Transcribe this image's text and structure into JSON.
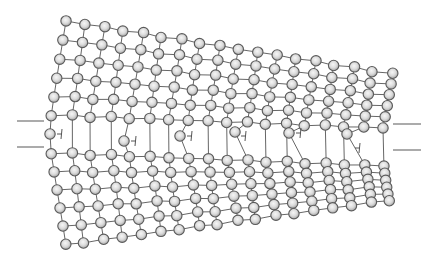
{
  "diagram": {
    "type": "crystal-lattice",
    "colors": {
      "background": "#ffffff",
      "atom_fill_center": "#f4f4f4",
      "atom_fill_edge": "#a8a8a8",
      "atom_stroke": "#5a5a5a",
      "bond": "#555555"
    },
    "atom_radius": 5.2,
    "columns": 18,
    "upper_rows": 6,
    "lower_rows": 6,
    "corners": {
      "top_left": [
        66,
        21
      ],
      "top_right": [
        392,
        74
      ],
      "mid_left_upper": [
        52,
        115
      ],
      "mid_right_upper": [
        383,
        128
      ],
      "mid_left_lower": [
        52,
        153
      ],
      "mid_right_lower": [
        384,
        166
      ],
      "bottom_left": [
        65,
        245
      ],
      "bottom_right": [
        390,
        200
      ]
    },
    "extra_half_plane_atoms": [
      {
        "col": 0,
        "x": 50,
        "y": 134
      },
      {
        "col": 4,
        "x": 124,
        "y": 141
      },
      {
        "col": 7,
        "x": 180,
        "y": 136
      },
      {
        "col": 10,
        "x": 235,
        "y": 132
      },
      {
        "col": 13,
        "x": 289,
        "y": 133
      },
      {
        "col": 16,
        "x": 347,
        "y": 134
      }
    ],
    "dislocations": [
      {
        "x": 60,
        "y": 134,
        "symbol": "⊣"
      },
      {
        "x": 134,
        "y": 141,
        "symbol": "⊣"
      },
      {
        "x": 190,
        "y": 136,
        "symbol": "⊣"
      },
      {
        "x": 244,
        "y": 136,
        "symbol": "⊣"
      },
      {
        "x": 299,
        "y": 133,
        "symbol": "⊣"
      },
      {
        "x": 358,
        "y": 148,
        "symbol": "⊣"
      }
    ],
    "reference_lines": [
      {
        "side": "left",
        "x1": 17,
        "x2": 44,
        "y": 121
      },
      {
        "side": "left",
        "x1": 17,
        "x2": 44,
        "y": 147
      },
      {
        "side": "right",
        "x1": 393,
        "x2": 421,
        "y": 124
      },
      {
        "side": "right",
        "x1": 393,
        "x2": 421,
        "y": 150
      }
    ]
  }
}
